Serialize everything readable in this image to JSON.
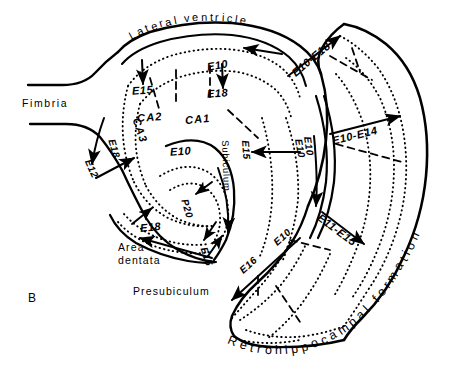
{
  "figure": {
    "panel_label": "B"
  },
  "colors": {
    "ink": "#000000",
    "background": "#ffffff"
  },
  "regions": [
    {
      "id": "lateral-ventricle",
      "label": "Lateral ventricle",
      "style": "curved"
    },
    {
      "id": "fimbria",
      "label": "Fimbria",
      "style": "straight"
    },
    {
      "id": "ca1",
      "label": "CA1",
      "style": "straight"
    },
    {
      "id": "ca2",
      "label": "CA2",
      "style": "straight"
    },
    {
      "id": "ca3",
      "label": "CA3",
      "style": "rotated"
    },
    {
      "id": "area-dentata",
      "label_line1": "Area",
      "label_line2": "dentata",
      "style": "straight"
    },
    {
      "id": "presubiculum",
      "label": "Presubiculum",
      "style": "straight"
    },
    {
      "id": "subiculum",
      "label": "Subiculum",
      "style": "rotated"
    },
    {
      "id": "retrohippocampal-formation",
      "label": "Retrohippocampal formation",
      "style": "curved"
    }
  ],
  "age_labels": [
    {
      "id": "e10-ca1-ventricle",
      "text": "E10"
    },
    {
      "id": "e15-ca2",
      "text": "E15"
    },
    {
      "id": "e18-ca1",
      "text": "E18"
    },
    {
      "id": "e18-ca3",
      "text": "E18"
    },
    {
      "id": "e12-fimbria",
      "text": "E12"
    },
    {
      "id": "e10-hilus",
      "text": "E10"
    },
    {
      "id": "p20-dentate",
      "text": "P20"
    },
    {
      "id": "e18-dentate",
      "text": "E18"
    },
    {
      "id": "e15-dentate",
      "text": "E15"
    },
    {
      "id": "e15-subiculum",
      "text": "E15"
    },
    {
      "id": "e10-subiculum-arrow",
      "text": "E10"
    },
    {
      "id": "e10-presubiculum-arrow",
      "text": "E10"
    },
    {
      "id": "e16-presubiculum",
      "text": "E16"
    },
    {
      "id": "e10-e18-retro",
      "text": "E10-E18"
    },
    {
      "id": "e10-e14-retro",
      "text": "E10-E14"
    },
    {
      "id": "e11-e15-retro",
      "text": "E11-E15"
    },
    {
      "id": "e10-vertical-retro",
      "text": "E10"
    }
  ],
  "legend_note": {
    "e_prefix_meaning": "E = embryonic day",
    "p_prefix_meaning": "P = postnatal day"
  }
}
